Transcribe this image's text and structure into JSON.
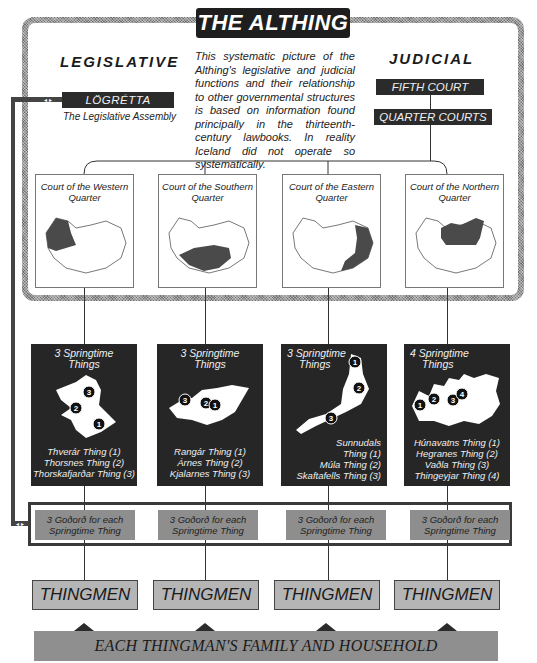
{
  "title": "THE ALTHING",
  "legislative": {
    "heading": "LEGISLATIVE",
    "assembly_name": "LÖGRÉTTA",
    "assembly_caption": "The Legislative Assembly",
    "connector_glyph": "◂ ▸"
  },
  "judicial": {
    "heading": "JUDICIAL",
    "fifth_court": "FIFTH COURT",
    "quarter_courts": "QUARTER COURTS"
  },
  "note": "This systematic picture of the Althing's legislative and judicial functions and their relationship to other governmental structures is based on information found principally in the thirteenth-century lawbooks. In reality Iceland did not operate so systematically.",
  "courts": [
    {
      "title": "Court of the Western Quarter",
      "shaded_region": "west"
    },
    {
      "title": "Court of the Southern Quarter",
      "shaded_region": "south"
    },
    {
      "title": "Court of the Eastern Quarter",
      "shaded_region": "east"
    },
    {
      "title": "Court of the Northern Quarter",
      "shaded_region": "north"
    }
  ],
  "springtime": [
    {
      "title_line1": "3 Springtime",
      "title_line2": "Things",
      "things": [
        "Thverár Thing (1)",
        "Thorsnes Thing (2)",
        "Thorskafjarðar Thing (3)"
      ],
      "markers": [
        "1",
        "2",
        "3"
      ]
    },
    {
      "title_line1": "3 Springtime",
      "title_line2": "Things",
      "things": [
        "Rangár Thing (1)",
        "Árnes  Thing (2)",
        "Kjalarnes Thing (3)"
      ],
      "markers": [
        "1",
        "2",
        "3"
      ]
    },
    {
      "title_line1": "3 Springtime",
      "title_line2": "Things",
      "things": [
        "Sunnudals",
        "Thing (1)",
        "Múla Thing (2)",
        "Skaftafells Thing (3)"
      ],
      "markers": [
        "1",
        "2",
        "3"
      ]
    },
    {
      "title_line1": "4 Springtime",
      "title_line2": "Things",
      "things": [
        "Húnavatns Thing (1)",
        "Hegranes Thing (2)",
        "Vaðla Thing (3)",
        "Thingeyjar Thing (4)"
      ],
      "markers": [
        "1",
        "2",
        "3",
        "4"
      ]
    }
  ],
  "godord": [
    {
      "line1": "3 Goðorð for each",
      "line2": "Springtime Thing"
    },
    {
      "line1": "3 Goðorð for each",
      "line2": "Springtime Thing"
    },
    {
      "line1": "3 Goðorð for each",
      "line2": "Springtime Thing"
    },
    {
      "line1": "3 Goðorð for each",
      "line2": "Springtime Thing"
    }
  ],
  "thingmen": [
    "THINGMEN",
    "THINGMEN",
    "THINGMEN",
    "THINGMEN"
  ],
  "family": "EACH THINGMAN'S FAMILY AND HOUSEHOLD",
  "colors": {
    "dark_box": "#262626",
    "frame_gray": "#9a9a9a",
    "godord_gray": "#8e8e8e",
    "thingmen_gray": "#b5b5b5",
    "family_gray": "#8f8f8f"
  }
}
